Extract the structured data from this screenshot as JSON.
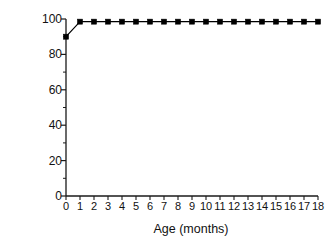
{
  "chart_data": {
    "type": "line",
    "title": "",
    "subtitle": "",
    "xlabel": "Age (months)",
    "ylabel": "Infants (%)",
    "x": [
      0,
      1,
      2,
      3,
      4,
      5,
      6,
      7,
      8,
      9,
      10,
      11,
      12,
      13,
      14,
      15,
      16,
      17,
      18
    ],
    "xtick_labels": [
      "0",
      "1",
      "2",
      "3",
      "4",
      "5",
      "6",
      "7",
      "8",
      "9",
      "10",
      "11",
      "12",
      "13",
      "14",
      "15",
      "16",
      "17",
      "18"
    ],
    "ytick_labels": [
      "0",
      "20",
      "40",
      "60",
      "80",
      "100"
    ],
    "yticks": [
      0,
      20,
      40,
      60,
      80,
      100
    ],
    "y_minor_ticks": [
      10,
      30,
      50,
      70,
      90
    ],
    "xlim": [
      0,
      18
    ],
    "ylim": [
      0,
      100
    ],
    "grid": false,
    "legend": null,
    "legend_position": "none",
    "series": [
      {
        "name": "Infants (%)",
        "color": "#000000",
        "marker": "square",
        "line_width": 1.2,
        "marker_size": 5,
        "values": [
          90,
          98.5,
          98.5,
          98.5,
          98.5,
          98.5,
          98.5,
          98.5,
          98.5,
          98.5,
          98.5,
          98.5,
          98.5,
          98.5,
          98.5,
          98.5,
          98.5,
          98.5,
          98.5
        ]
      }
    ],
    "annotations": [],
    "spines": {
      "left": true,
      "bottom": true,
      "top": false,
      "right": false
    },
    "background_color": "#ffffff",
    "axis_color": "#1a1a1a"
  }
}
